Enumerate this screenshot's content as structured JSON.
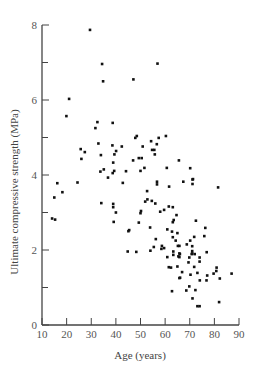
{
  "chart_data": {
    "type": "scatter",
    "title": "",
    "xlabel": "Age (years)",
    "ylabel": "Ultimate compressive strength (MPa)",
    "xlim": [
      10,
      90
    ],
    "ylim": [
      0,
      8
    ],
    "x_ticks": [
      10,
      20,
      30,
      40,
      50,
      60,
      70,
      80,
      90
    ],
    "y_ticks_labeled": [
      0,
      2,
      4,
      6,
      8
    ],
    "y_ticks_minor": [
      1,
      3,
      5,
      7
    ],
    "grid": false,
    "legend": null,
    "series": [
      {
        "name": "specimens",
        "points": [
          [
            29.5,
            7.87
          ],
          [
            34.4,
            6.96
          ],
          [
            34.8,
            6.5
          ],
          [
            21.0,
            6.03
          ],
          [
            56.9,
            6.97
          ],
          [
            47.1,
            6.55
          ],
          [
            19.9,
            5.57
          ],
          [
            32.5,
            5.41
          ],
          [
            38.7,
            5.39
          ],
          [
            31.7,
            5.25
          ],
          [
            32.9,
            4.84
          ],
          [
            38.6,
            4.79
          ],
          [
            25.7,
            4.69
          ],
          [
            27.4,
            4.61
          ],
          [
            40.1,
            4.64
          ],
          [
            39.4,
            4.55
          ],
          [
            33.9,
            4.53
          ],
          [
            26.0,
            4.43
          ],
          [
            38.9,
            4.33
          ],
          [
            35.1,
            4.15
          ],
          [
            33.7,
            4.09
          ],
          [
            39.3,
            4.11
          ],
          [
            38.7,
            4.05
          ],
          [
            36.8,
            3.93
          ],
          [
            48.5,
            5.04
          ],
          [
            47.9,
            4.99
          ],
          [
            60.3,
            5.04
          ],
          [
            57.4,
            4.99
          ],
          [
            54.3,
            4.9
          ],
          [
            56.6,
            4.82
          ],
          [
            42.4,
            4.76
          ],
          [
            50.9,
            4.76
          ],
          [
            54.7,
            4.67
          ],
          [
            55.6,
            4.67
          ],
          [
            55.8,
            4.55
          ],
          [
            49.3,
            4.45
          ],
          [
            50.5,
            4.45
          ],
          [
            47.0,
            4.39
          ],
          [
            65.6,
            4.39
          ],
          [
            51.6,
            4.19
          ],
          [
            60.7,
            4.19
          ],
          [
            70.2,
            4.18
          ],
          [
            50.0,
            4.11
          ],
          [
            44.1,
            4.1
          ],
          [
            71.3,
            3.89
          ],
          [
            16.2,
            3.78
          ],
          [
            24.4,
            3.8
          ],
          [
            18.3,
            3.54
          ],
          [
            15.0,
            3.4
          ],
          [
            34.1,
            3.25
          ],
          [
            38.9,
            3.23
          ],
          [
            38.9,
            3.14
          ],
          [
            40.0,
            3.0
          ],
          [
            14.1,
            2.84
          ],
          [
            15.3,
            2.81
          ],
          [
            39.1,
            2.75
          ],
          [
            42.8,
            3.79
          ],
          [
            56.7,
            3.82
          ],
          [
            56.7,
            3.75
          ],
          [
            61.6,
            3.69
          ],
          [
            52.7,
            3.57
          ],
          [
            52.8,
            3.35
          ],
          [
            51.9,
            3.29
          ],
          [
            54.6,
            3.31
          ],
          [
            56.0,
            3.24
          ],
          [
            61.5,
            3.16
          ],
          [
            63.1,
            3.14
          ],
          [
            59.6,
            3.07
          ],
          [
            58.0,
            3.02
          ],
          [
            50.2,
            3.04
          ],
          [
            50.0,
            2.98
          ],
          [
            64.6,
            2.93
          ],
          [
            63.5,
            2.8
          ],
          [
            63.1,
            2.74
          ],
          [
            49.3,
            2.73
          ],
          [
            53.9,
            2.6
          ],
          [
            60.9,
            2.55
          ],
          [
            45.4,
            2.53
          ],
          [
            45.1,
            2.5
          ],
          [
            62.8,
            2.49
          ],
          [
            63.1,
            2.34
          ],
          [
            56.2,
            2.29
          ],
          [
            64.3,
            2.25
          ],
          [
            65.2,
            2.11
          ],
          [
            55.4,
            2.08
          ],
          [
            58.7,
            2.11
          ],
          [
            59.6,
            2.05
          ],
          [
            58.5,
            2.03
          ],
          [
            54.0,
            1.98
          ],
          [
            63.3,
            1.96
          ],
          [
            44.8,
            1.96
          ],
          [
            48.3,
            1.95
          ],
          [
            67.4,
            3.82
          ],
          [
            71.1,
            3.88
          ],
          [
            71.1,
            3.76
          ],
          [
            81.5,
            3.67
          ],
          [
            72.5,
            2.78
          ],
          [
            76.3,
            2.59
          ],
          [
            65.0,
            2.45
          ],
          [
            75.9,
            2.37
          ],
          [
            71.8,
            2.35
          ],
          [
            70.2,
            2.25
          ],
          [
            68.8,
            2.15
          ],
          [
            71.0,
            2.1
          ],
          [
            65.8,
            2.11
          ],
          [
            71.0,
            1.97
          ],
          [
            76.9,
            1.94
          ],
          [
            66.0,
            1.89
          ],
          [
            72.0,
            1.89
          ],
          [
            70.8,
            1.89
          ],
          [
            63.3,
            1.87
          ],
          [
            60.9,
            1.81
          ],
          [
            65.4,
            1.83
          ],
          [
            61.5,
            1.54
          ],
          [
            62.4,
            1.53
          ],
          [
            65.0,
            1.56
          ],
          [
            65.8,
            1.25
          ],
          [
            62.8,
            0.9
          ],
          [
            65.8,
            1.91
          ],
          [
            65.8,
            1.81
          ],
          [
            71.0,
            1.91
          ],
          [
            74.0,
            1.8
          ],
          [
            69.8,
            1.8
          ],
          [
            74.0,
            1.69
          ],
          [
            69.5,
            1.67
          ],
          [
            71.8,
            1.55
          ],
          [
            66.9,
            1.41
          ],
          [
            73.1,
            1.39
          ],
          [
            80.9,
            1.53
          ],
          [
            80.8,
            1.44
          ],
          [
            79.7,
            1.37
          ],
          [
            87.0,
            1.37
          ],
          [
            77.1,
            1.32
          ],
          [
            66.1,
            1.26
          ],
          [
            70.3,
            1.34
          ],
          [
            82.2,
            1.24
          ],
          [
            74.1,
            1.19
          ],
          [
            76.8,
            1.19
          ],
          [
            69.8,
            1.03
          ],
          [
            68.6,
            0.92
          ],
          [
            72.3,
            0.93
          ],
          [
            71.1,
            0.71
          ],
          [
            81.9,
            0.61
          ],
          [
            73.1,
            0.5
          ],
          [
            74.0,
            0.5
          ]
        ]
      }
    ]
  }
}
